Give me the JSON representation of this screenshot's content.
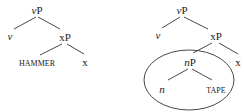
{
  "trees": [
    {
      "root": {
        "head": "v",
        "suffix": "P"
      },
      "left": "v",
      "right": {
        "head": "x",
        "suffix": "P"
      },
      "complement": "HAMMER",
      "terminal": "x"
    },
    {
      "root": {
        "head": "v",
        "suffix": "P"
      },
      "left": "v",
      "right": {
        "head": "x",
        "suffix": "P"
      },
      "circled_node": {
        "head": "n",
        "suffix": "P"
      },
      "circled_left": "n",
      "circled_right": "TAPE",
      "terminal": "x"
    }
  ]
}
